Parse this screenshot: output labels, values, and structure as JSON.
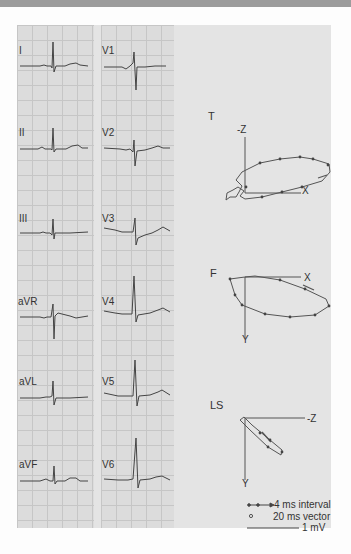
{
  "figure": {
    "left_column_leads": [
      "I",
      "II",
      "III",
      "aVR",
      "aVL",
      "aVF"
    ],
    "right_column_leads": [
      "V1",
      "V2",
      "V3",
      "V4",
      "V5",
      "V6"
    ],
    "vector_loops": [
      {
        "plane": "T",
        "axes": {
          "vertical": "-Z",
          "horizontal": "X"
        }
      },
      {
        "plane": "F",
        "axes": {
          "vertical": "Y",
          "horizontal": "X"
        }
      },
      {
        "plane": "LS",
        "axes": {
          "vertical": "Y",
          "horizontal": "-Z"
        }
      }
    ],
    "legend": {
      "interval": "4 ms interval",
      "vector": "20 ms vector",
      "scale": "1 mV"
    }
  }
}
